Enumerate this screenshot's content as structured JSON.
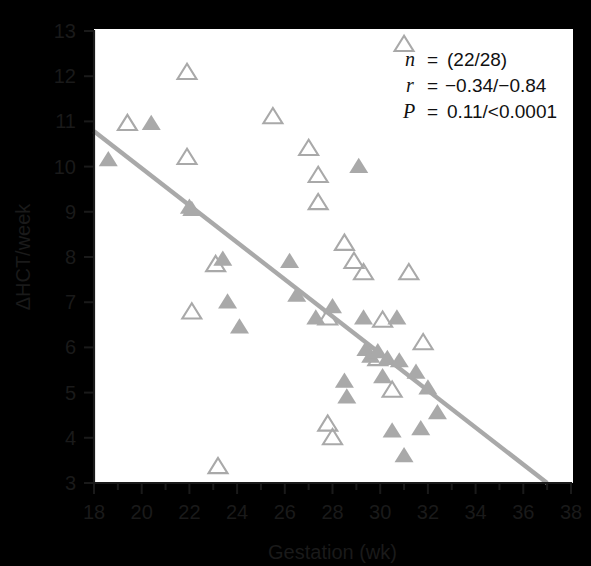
{
  "figure": {
    "background": "#f7f7f5",
    "plot_background": "#ffffff",
    "marker_color": "#a9a9a9",
    "line_color": "#a9a9a9",
    "axis_color": "#1a1a1a"
  },
  "annotation": {
    "n_symbol": "n",
    "n_eq": "=",
    "n_value": "(22/28)",
    "r_symbol": "r",
    "r_eq": "=",
    "r_value": "−0.34/−0.84",
    "p_symbol": "P",
    "p_eq": "=",
    "p_value": "0.11/<0.0001"
  },
  "chart_data": {
    "type": "scatter",
    "title": "",
    "xlabel": "Gestation (wk)",
    "ylabel": "ΔHCT/week",
    "xlim": [
      18,
      38
    ],
    "ylim": [
      3,
      13
    ],
    "xticks": [
      18,
      20,
      22,
      24,
      26,
      28,
      30,
      32,
      34,
      36,
      38
    ],
    "xtick_labels": [
      "18",
      "20",
      "22",
      "24",
      "26",
      "28",
      "30",
      "32",
      "34",
      "36",
      "38"
    ],
    "yticks": [
      3,
      4,
      5,
      6,
      7,
      8,
      9,
      10,
      11,
      12,
      13
    ],
    "ytick_labels": [
      "3",
      "4",
      "5",
      "6",
      "7",
      "8",
      "9",
      "10",
      "11",
      "12",
      "13"
    ],
    "xminor_step": 1,
    "grid": false,
    "legend": null,
    "series": [
      {
        "name": "open-triangle-group",
        "marker": "triangle-open",
        "color": "#a9a9a9",
        "n": 22,
        "points": [
          [
            19.4,
            10.95
          ],
          [
            21.9,
            12.08
          ],
          [
            21.9,
            10.2
          ],
          [
            22.1,
            6.78
          ],
          [
            23.1,
            7.83
          ],
          [
            23.2,
            3.36
          ],
          [
            25.5,
            11.1
          ],
          [
            27.0,
            10.4
          ],
          [
            27.4,
            9.8
          ],
          [
            27.4,
            9.2
          ],
          [
            27.8,
            6.65
          ],
          [
            27.8,
            4.3
          ],
          [
            28.0,
            4.0
          ],
          [
            28.5,
            8.3
          ],
          [
            28.9,
            7.9
          ],
          [
            29.3,
            7.65
          ],
          [
            29.9,
            5.75
          ],
          [
            30.1,
            6.6
          ],
          [
            30.5,
            5.05
          ],
          [
            31.0,
            12.7
          ],
          [
            31.2,
            7.65
          ],
          [
            31.8,
            6.1
          ]
        ]
      },
      {
        "name": "filled-triangle-group",
        "marker": "triangle-filled",
        "color": "#a9a9a9",
        "n": 28,
        "points": [
          [
            18.6,
            10.15
          ],
          [
            20.4,
            10.95
          ],
          [
            22.0,
            9.1
          ],
          [
            22.1,
            9.05
          ],
          [
            23.4,
            7.95
          ],
          [
            23.6,
            7.0
          ],
          [
            24.1,
            6.45
          ],
          [
            26.2,
            7.9
          ],
          [
            26.5,
            7.15
          ],
          [
            27.3,
            6.65
          ],
          [
            28.0,
            6.9
          ],
          [
            28.5,
            5.25
          ],
          [
            28.6,
            4.9
          ],
          [
            29.1,
            10.0
          ],
          [
            29.3,
            6.65
          ],
          [
            29.4,
            5.95
          ],
          [
            29.6,
            5.8
          ],
          [
            29.9,
            5.9
          ],
          [
            30.1,
            5.35
          ],
          [
            30.3,
            5.75
          ],
          [
            30.5,
            4.15
          ],
          [
            30.7,
            6.65
          ],
          [
            30.8,
            5.7
          ],
          [
            31.0,
            3.6
          ],
          [
            31.5,
            5.45
          ],
          [
            31.7,
            4.2
          ],
          [
            32.0,
            5.1
          ],
          [
            32.4,
            4.55
          ]
        ]
      }
    ],
    "regression_line": {
      "color": "#a9a9a9",
      "x_start": 18.0,
      "y_start": 10.78,
      "x_end": 37.0,
      "y_end": 3.0
    }
  }
}
